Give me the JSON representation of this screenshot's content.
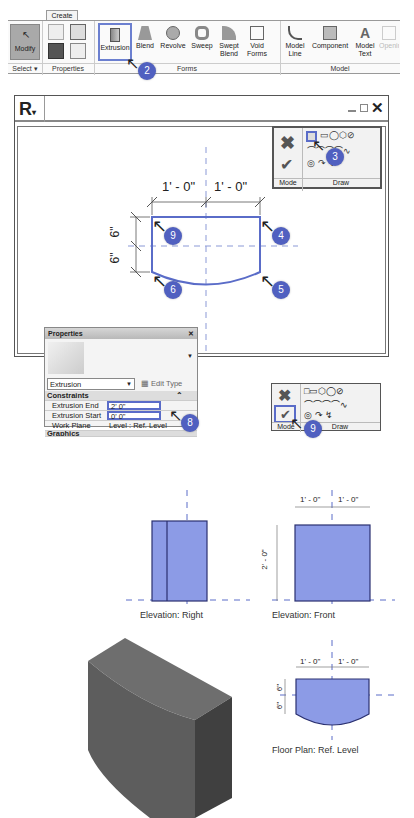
{
  "ribbon": {
    "tab": "Create",
    "select_label": "Select",
    "modify_label": "Modify",
    "panels": {
      "select": "Select",
      "properties": "Properties",
      "forms": "Forms",
      "model": "Model"
    },
    "forms_tools": [
      "Extrusion",
      "Blend",
      "Revolve",
      "Sweep",
      "Swept Blend",
      "Void Forms"
    ],
    "model_tools": [
      "Model Line",
      "Component",
      "Model Text",
      "Opening"
    ],
    "active_tool": "Extrusion"
  },
  "window": {
    "logo": "R",
    "controls": [
      "minimize",
      "restore",
      "close"
    ]
  },
  "mode_draw": {
    "mode_label": "Mode",
    "draw_label": "Draw",
    "cancel_icon": "x-icon",
    "finish_icon": "check-icon"
  },
  "sketch": {
    "dims_top": [
      "1' - 0\"",
      "1' - 0\""
    ],
    "dims_left": [
      "6\"",
      "6\""
    ]
  },
  "steps": [
    "2",
    "3",
    "4",
    "5",
    "6",
    "7",
    "8",
    "9"
  ],
  "properties": {
    "title": "Properties",
    "type_selector": "Extrusion",
    "edit_type": "Edit Type",
    "section": "Constraints",
    "rows": [
      {
        "name": "Extrusion End",
        "value": "2' 0\""
      },
      {
        "name": "Extrusion Start",
        "value": "0' 0\""
      },
      {
        "name": "Work Plane",
        "value": "Level : Ref. Level"
      }
    ],
    "next_section": "Graphics"
  },
  "views": {
    "elev_right": "Elevation: Right",
    "elev_front": "Elevation: Front",
    "floor_plan": "Floor Plan: Ref. Level",
    "front_dims": [
      "1' - 0\"",
      "1' - 0\""
    ],
    "front_height": "2' - 0\"",
    "plan_dims": [
      "1' - 0\"",
      "1' - 0\""
    ],
    "plan_side": [
      "6\"",
      "6\""
    ]
  },
  "colors": {
    "accent": "#5060c0",
    "fill": "#8c9be6",
    "outline": "#2a3070",
    "solid": "#5a5a5a"
  }
}
